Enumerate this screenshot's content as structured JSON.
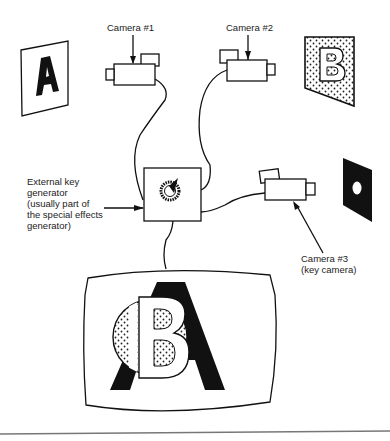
{
  "diagram": {
    "labels": {
      "camera1": "Camera #1",
      "camera2": "Camera #2",
      "camera3_line1": "Camera #3",
      "camera3_line2": "(key camera)",
      "key_gen_line1": "External key",
      "key_gen_line2": "generator",
      "key_gen_line3": "(usually part of",
      "key_gen_line4": "the special effects",
      "key_gen_line5": "generator)"
    },
    "cards": {
      "card_a_letter": "A",
      "card_b_letter": "B"
    },
    "colors": {
      "ink": "#111111",
      "background": "#ffffff",
      "rule": "#777777"
    }
  }
}
